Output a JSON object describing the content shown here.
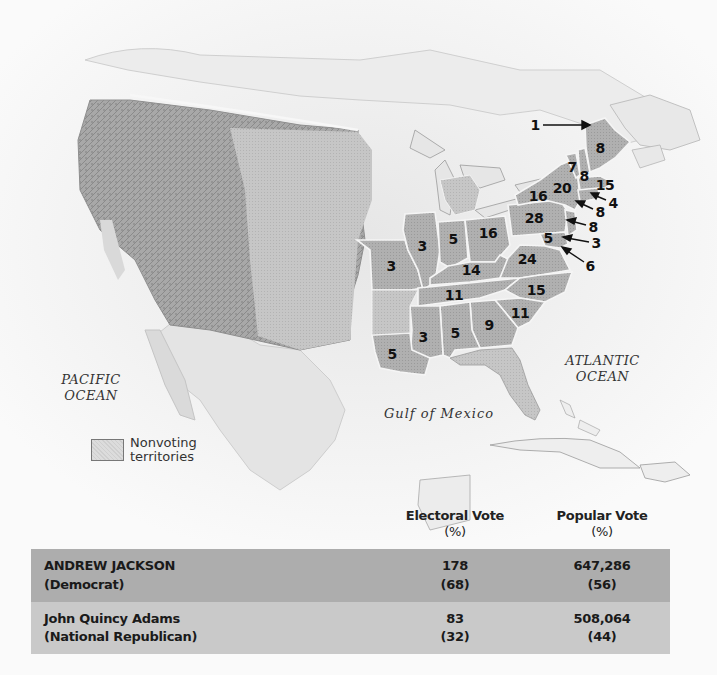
{
  "map": {
    "water_labels": {
      "pacific": [
        "PACIFIC",
        "OCEAN"
      ],
      "atlantic": [
        "ATLANTIC",
        "OCEAN"
      ],
      "gulf": "Gulf of Mexico"
    },
    "legend": {
      "swatch": "Nonvoting territories",
      "line1": "Nonvoting",
      "line2": "territories"
    },
    "colors": {
      "voting_state_fill": "#a9a9a9",
      "state_border": "#f2f2f2",
      "territory_fill": "#c4c4c4",
      "water": "#f3f3f3"
    },
    "electoral_votes": [
      {
        "state": "Maine (north note)",
        "value": "1",
        "x": 535,
        "y": 125,
        "arrow": true
      },
      {
        "state": "Maine",
        "value": "8",
        "x": 600,
        "y": 148
      },
      {
        "state": "Vermont",
        "value": "7",
        "x": 572,
        "y": 167
      },
      {
        "state": "New Hampshire",
        "value": "8",
        "x": 584,
        "y": 176
      },
      {
        "state": "Massachusetts",
        "value": "15",
        "x": 605,
        "y": 185
      },
      {
        "state": "New York",
        "value": "20",
        "x": 562,
        "y": 188
      },
      {
        "state": "New York (west)",
        "value": "16",
        "x": 538,
        "y": 196
      },
      {
        "state": "Rhode Island",
        "value": "4",
        "x": 613,
        "y": 203,
        "arrow": true
      },
      {
        "state": "Connecticut",
        "value": "8",
        "x": 600,
        "y": 212,
        "arrow": true
      },
      {
        "state": "New Jersey",
        "value": "8",
        "x": 593,
        "y": 227,
        "arrow": true
      },
      {
        "state": "Pennsylvania",
        "value": "28",
        "x": 534,
        "y": 218
      },
      {
        "state": "Ohio",
        "value": "16",
        "x": 488,
        "y": 233
      },
      {
        "state": "Delaware",
        "value": "3",
        "x": 596,
        "y": 243,
        "arrow": true
      },
      {
        "state": "Maryland",
        "value": "5",
        "x": 548,
        "y": 238
      },
      {
        "state": "Maryland (east)",
        "value": "6",
        "x": 590,
        "y": 266,
        "arrow": true
      },
      {
        "state": "Virginia",
        "value": "24",
        "x": 527,
        "y": 259
      },
      {
        "state": "Indiana",
        "value": "5",
        "x": 453,
        "y": 239
      },
      {
        "state": "Illinois",
        "value": "3",
        "x": 422,
        "y": 246
      },
      {
        "state": "Missouri",
        "value": "3",
        "x": 391,
        "y": 266
      },
      {
        "state": "Kentucky",
        "value": "14",
        "x": 471,
        "y": 270
      },
      {
        "state": "Tennessee",
        "value": "11",
        "x": 454,
        "y": 295
      },
      {
        "state": "North Carolina",
        "value": "15",
        "x": 536,
        "y": 290
      },
      {
        "state": "South Carolina",
        "value": "11",
        "x": 520,
        "y": 313
      },
      {
        "state": "Georgia",
        "value": "9",
        "x": 489,
        "y": 325
      },
      {
        "state": "Alabama",
        "value": "5",
        "x": 455,
        "y": 333
      },
      {
        "state": "Mississippi",
        "value": "3",
        "x": 423,
        "y": 337
      },
      {
        "state": "Louisiana",
        "value": "5",
        "x": 392,
        "y": 354
      }
    ]
  },
  "results_table": {
    "headers": {
      "candidate": "",
      "electoral": {
        "line1": "Electoral Vote",
        "line2": "(%)"
      },
      "popular": {
        "line1": "Popular Vote",
        "line2": "(%)"
      }
    },
    "rows": [
      {
        "name": "ANDREW JACKSON",
        "party": "(Democrat)",
        "electoral_votes": "178",
        "electoral_pct": "(68)",
        "popular_votes": "647,286",
        "popular_pct": "(56)",
        "winner": true
      },
      {
        "name": "John Quincy Adams",
        "party": "(National Republican)",
        "electoral_votes": "83",
        "electoral_pct": "(32)",
        "popular_votes": "508,064",
        "popular_pct": "(44)",
        "winner": false
      }
    ],
    "colors": {
      "winner_row": "#adadad",
      "loser_row": "#c9c9c9"
    }
  }
}
